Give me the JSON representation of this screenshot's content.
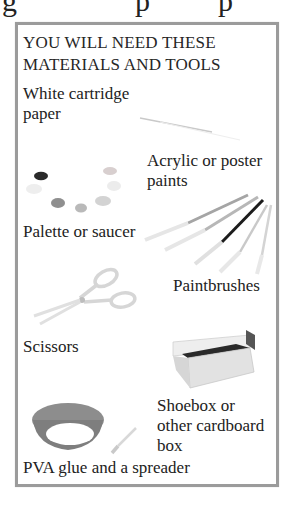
{
  "page": {
    "top_fragment_glyphs": [
      "g",
      "p",
      "p"
    ]
  },
  "panel": {
    "heading_line1": "YOU WILL NEED THESE",
    "heading_line2": "MATERIALS AND TOOLS",
    "border_color": "#9b9b9b",
    "items": [
      {
        "id": "paper",
        "lines": [
          "White cartridge",
          "paper"
        ],
        "icon": "paper-sheet-icon"
      },
      {
        "id": "paints",
        "lines": [
          "Acrylic or poster",
          "paints"
        ],
        "icon": "paint-blobs-icon"
      },
      {
        "id": "palette",
        "lines": [
          "Palette or saucer"
        ],
        "icon": "palette-icon"
      },
      {
        "id": "brushes",
        "lines": [
          "Paintbrushes"
        ],
        "icon": "paintbrushes-icon"
      },
      {
        "id": "scissors",
        "lines": [
          "Scissors"
        ],
        "icon": "scissors-icon"
      },
      {
        "id": "shoebox",
        "lines": [
          "Shoebox or",
          "other cardboard",
          "box"
        ],
        "icon": "shoebox-icon"
      },
      {
        "id": "glue",
        "lines": [
          "PVA glue and a spreader"
        ],
        "icon": "glue-bowl-icon"
      }
    ]
  }
}
